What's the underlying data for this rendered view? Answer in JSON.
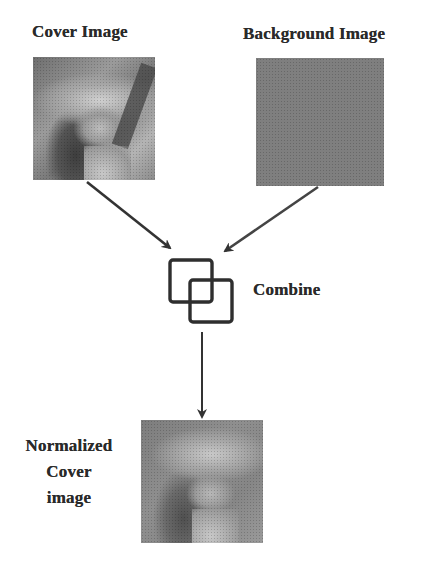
{
  "diagram": {
    "nodes": {
      "cover": {
        "label": "Cover Image"
      },
      "background": {
        "label": "Background Image"
      },
      "combine": {
        "label": "Combine",
        "icon": "overlapping-squares-icon"
      },
      "output": {
        "label_lines": [
          "Normalized",
          "Cover",
          "image"
        ]
      }
    },
    "edges": [
      {
        "from": "cover",
        "to": "combine"
      },
      {
        "from": "background",
        "to": "combine"
      },
      {
        "from": "combine",
        "to": "output"
      }
    ],
    "colors": {
      "text": "#2a2a2a",
      "arrow": "#333333",
      "background_image_fill": "#7f7f7f"
    }
  }
}
